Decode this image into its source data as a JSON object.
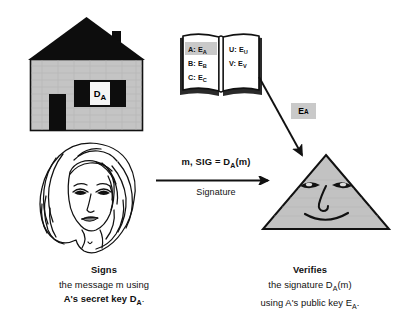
{
  "diagram": {
    "colors": {
      "ink": "#111111",
      "roof": "#0d0d0d",
      "wall": "#c4c4c4",
      "triangle_fill": "#c2c2c2",
      "highlight": "#c9c9c9",
      "page": "#ffffff"
    }
  },
  "house": {
    "name": "house",
    "window_label": "D",
    "window_label_sub": "A"
  },
  "directory": {
    "name": "public-key-directory-book",
    "left_page": [
      {
        "key": "A:",
        "value": "E",
        "sub": "A",
        "highlighted": true
      },
      {
        "key": "B:",
        "value": "E",
        "sub": "B",
        "highlighted": false
      },
      {
        "key": "C:",
        "value": "E",
        "sub": "C",
        "highlighted": false
      }
    ],
    "right_page": [
      {
        "key": "U:",
        "value": "E",
        "sub": "U",
        "highlighted": false
      },
      {
        "key": "V:",
        "value": "E",
        "sub": "V",
        "highlighted": false
      }
    ]
  },
  "key_chip": {
    "label": "E",
    "label_sub": "A"
  },
  "signature_arrow": {
    "top_label": "m, SIG  =  D",
    "top_label_sub": "A",
    "top_label_tail": "(m)",
    "bottom_label": "Signature"
  },
  "captions": {
    "left": {
      "heading": "Signs",
      "line1": "the message  m  using",
      "line2_pre": "A's secret key  D",
      "line2_sub": "A",
      "line2_post": "."
    },
    "right": {
      "heading": "Verifies",
      "line1_pre": "the signature  D",
      "line1_sub": "A",
      "line1_post": "(m)",
      "line2_pre": "using  A's public key  E",
      "line2_sub": "A",
      "line2_post": "."
    }
  },
  "figures": {
    "signer": "woman-face-line-drawing",
    "verifier": "triangle-face"
  }
}
